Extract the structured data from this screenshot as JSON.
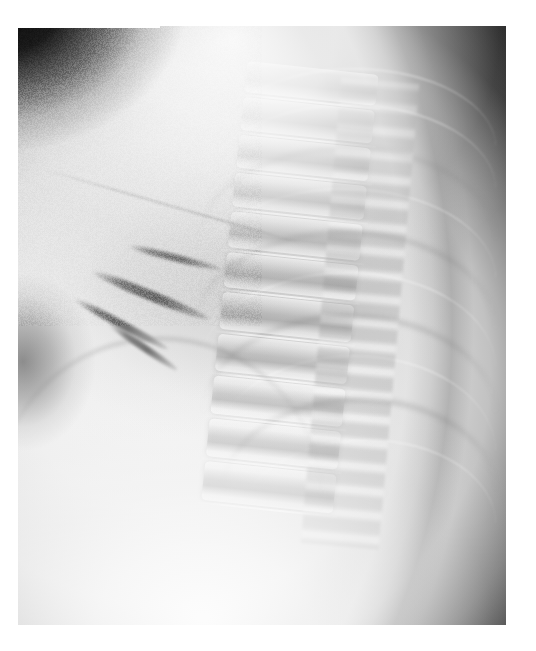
{
  "document": {
    "kind": "radiograph-scan",
    "modality": "X-ray",
    "view": "lateral",
    "region": "chest / thoracic spine",
    "page_background": "#ffffff",
    "label_band_text": ""
  },
  "film": {
    "left": 18,
    "top": 26,
    "width": 488,
    "height": 599,
    "background_color": "#141414"
  },
  "palette": {
    "page_white": "#ffffff",
    "air_black": "#101010",
    "soft_tissue_bright": "#f6f6f6",
    "lung_mid_gray": "#9a9a9a",
    "bone_highlight": "#ffffff",
    "border_rim": "#c4c4c4"
  },
  "anatomy": {
    "regions": [
      {
        "name": "posterior-air-field",
        "position": "right",
        "tone": "black"
      },
      {
        "name": "shoulder-soft-tissue",
        "position": "top-center",
        "tone": "bright"
      },
      {
        "name": "retrocardiac-lucency",
        "position": "center",
        "tone": "mid-gray"
      },
      {
        "name": "cardiac-shadow",
        "position": "left-center",
        "tone": "light-gray"
      },
      {
        "name": "sub-diaphragmatic-field",
        "position": "bottom-left",
        "tone": "bright"
      },
      {
        "name": "axillary-air-wedge",
        "position": "left-mid",
        "tone": "dark"
      },
      {
        "name": "supra-apical-air-wedge",
        "position": "top-left",
        "tone": "black"
      }
    ],
    "spine": {
      "label": "thoracic vertebral column",
      "tilt_degrees": 6,
      "vertebra_count": 11,
      "vertebrae": [
        {
          "top_pct": 0,
          "height_pct": 6.4
        },
        {
          "top_pct": 7.4,
          "height_pct": 6.6
        },
        {
          "top_pct": 15.0,
          "height_pct": 6.8
        },
        {
          "top_pct": 22.8,
          "height_pct": 7.0
        },
        {
          "top_pct": 30.8,
          "height_pct": 7.2
        },
        {
          "top_pct": 39.0,
          "height_pct": 7.3
        },
        {
          "top_pct": 47.3,
          "height_pct": 7.4
        },
        {
          "top_pct": 55.7,
          "height_pct": 7.6
        },
        {
          "top_pct": 64.3,
          "height_pct": 7.7
        },
        {
          "top_pct": 73.0,
          "height_pct": 7.8
        },
        {
          "top_pct": 81.8,
          "height_pct": 8.0
        }
      ],
      "disc_lines_pct": [
        6.8,
        14.4,
        22.2,
        30.2,
        38.4,
        46.7,
        55.1,
        63.7,
        72.4,
        81.2,
        90.2
      ]
    },
    "ribs": [
      {
        "left_pct": 40,
        "top_pct": 7,
        "width_pct": 58,
        "height_pct": 13,
        "tone": "bright"
      },
      {
        "left_pct": 38,
        "top_pct": 13,
        "width_pct": 60,
        "height_pct": 14,
        "tone": "bright"
      },
      {
        "left_pct": 37,
        "top_pct": 20,
        "width_pct": 61,
        "height_pct": 15,
        "tone": "dark"
      },
      {
        "left_pct": 36,
        "top_pct": 27,
        "width_pct": 62,
        "height_pct": 15,
        "tone": "bright"
      },
      {
        "left_pct": 36,
        "top_pct": 34,
        "width_pct": 62,
        "height_pct": 16,
        "tone": "dark"
      },
      {
        "left_pct": 37,
        "top_pct": 41,
        "width_pct": 61,
        "height_pct": 16,
        "tone": "bright"
      },
      {
        "left_pct": 38,
        "top_pct": 48,
        "width_pct": 60,
        "height_pct": 16,
        "tone": "dark"
      },
      {
        "left_pct": 40,
        "top_pct": 55,
        "width_pct": 58,
        "height_pct": 16,
        "tone": "bright"
      },
      {
        "left_pct": 42,
        "top_pct": 62,
        "width_pct": 56,
        "height_pct": 15,
        "tone": "dark"
      },
      {
        "left_pct": 45,
        "top_pct": 69,
        "width_pct": 53,
        "height_pct": 14,
        "tone": "bright"
      }
    ],
    "vessels": [
      {
        "left_pct": 14,
        "top_pct": 44,
        "width_pct": 26,
        "height_pct": 1.6,
        "rotate": 22
      },
      {
        "left_pct": 10,
        "top_pct": 49,
        "width_pct": 22,
        "height_pct": 1.3,
        "rotate": 28
      },
      {
        "left_pct": 22,
        "top_pct": 38,
        "width_pct": 20,
        "height_pct": 1.2,
        "rotate": 14
      },
      {
        "left_pct": 17,
        "top_pct": 53,
        "width_pct": 17,
        "height_pct": 1.1,
        "rotate": 34
      }
    ]
  }
}
